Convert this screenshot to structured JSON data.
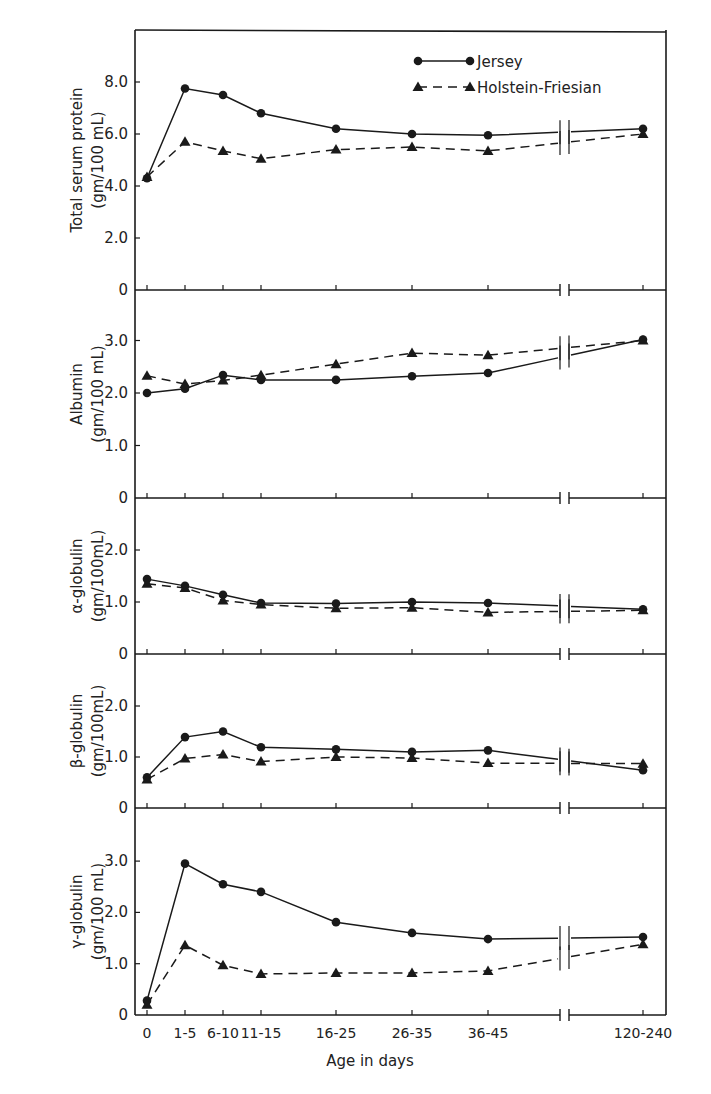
{
  "chart_data": {
    "type": "line",
    "xlabel": "Age in days",
    "categories": [
      "0",
      "1-5",
      "6-10",
      "11-15",
      "16-25",
      "26-35",
      "36-45",
      "120-240"
    ],
    "axis_break": "between 36-45 and 120-240",
    "legend": {
      "position": "top-right inside first panel",
      "entries": [
        {
          "name": "Jersey",
          "marker": "circle",
          "line": "solid"
        },
        {
          "name": "Holstein-Friesian",
          "marker": "triangle",
          "line": "dashed"
        }
      ]
    },
    "grid": false,
    "panels": [
      {
        "ylabel_line1": "Total serum protein",
        "ylabel_line2": "(gm/100 mL)",
        "ylim": [
          0,
          10
        ],
        "yticks": [
          0,
          2,
          4,
          6,
          8
        ],
        "ytick_labels": [
          "0",
          "2.0",
          "4.0",
          "6.0",
          "8.0"
        ],
        "series": [
          {
            "name": "Jersey",
            "values": [
              4.3,
              7.75,
              7.5,
              6.8,
              6.2,
              6.0,
              5.95,
              6.2
            ]
          },
          {
            "name": "Holstein-Friesian",
            "values": [
              4.35,
              5.7,
              5.35,
              5.05,
              5.4,
              5.5,
              5.35,
              6.0
            ]
          }
        ]
      },
      {
        "ylabel_line1": "Albumin",
        "ylabel_line2": "(gm/100 mL)",
        "ylim": [
          0,
          3.8
        ],
        "yticks": [
          0,
          1,
          2,
          3
        ],
        "ytick_labels": [
          "0",
          "1.0",
          "2.0",
          "3.0"
        ],
        "series": [
          {
            "name": "Jersey",
            "values": [
              2.0,
              2.08,
              2.34,
              2.25,
              2.25,
              2.32,
              2.38,
              3.02
            ]
          },
          {
            "name": "Holstein-Friesian",
            "values": [
              2.33,
              2.17,
              2.24,
              2.34,
              2.55,
              2.76,
              2.72,
              3.0
            ]
          }
        ]
      },
      {
        "ylabel_line1": "α-globulin",
        "ylabel_line2": "(gm/100mL)",
        "ylim": [
          0,
          3.0
        ],
        "yticks": [
          0,
          1,
          2
        ],
        "ytick_labels": [
          "0",
          "1.0",
          "2.0"
        ],
        "series": [
          {
            "name": "Jersey",
            "values": [
              1.44,
              1.31,
              1.14,
              0.98,
              0.97,
              1.0,
              0.98,
              0.86
            ]
          },
          {
            "name": "Holstein-Friesian",
            "values": [
              1.35,
              1.27,
              1.03,
              0.95,
              0.88,
              0.89,
              0.8,
              0.84
            ]
          }
        ]
      },
      {
        "ylabel_line1": "β-globulin",
        "ylabel_line2": "(gm/100mL)",
        "ylim": [
          0,
          3.0
        ],
        "yticks": [
          0,
          1,
          2
        ],
        "ytick_labels": [
          "0",
          "1.0",
          "2.0"
        ],
        "series": [
          {
            "name": "Jersey",
            "values": [
              0.6,
              1.39,
              1.5,
              1.19,
              1.15,
              1.1,
              1.13,
              0.74
            ]
          },
          {
            "name": "Holstein-Friesian",
            "values": [
              0.56,
              0.97,
              1.05,
              0.91,
              1.0,
              0.98,
              0.88,
              0.87
            ]
          }
        ]
      },
      {
        "ylabel_line1": "γ-globulin",
        "ylabel_line2": "(gm/100 mL)",
        "ylim": [
          0,
          3.8
        ],
        "yticks": [
          0,
          1,
          2,
          3
        ],
        "ytick_labels": [
          "0",
          "1.0",
          "2.0",
          "3.0"
        ],
        "series": [
          {
            "name": "Jersey",
            "values": [
              0.28,
              2.95,
              2.55,
              2.4,
              1.81,
              1.6,
              1.48,
              1.52
            ]
          },
          {
            "name": "Holstein-Friesian",
            "values": [
              0.2,
              1.36,
              0.97,
              0.8,
              0.82,
              0.82,
              0.86,
              1.38
            ]
          }
        ]
      }
    ]
  }
}
